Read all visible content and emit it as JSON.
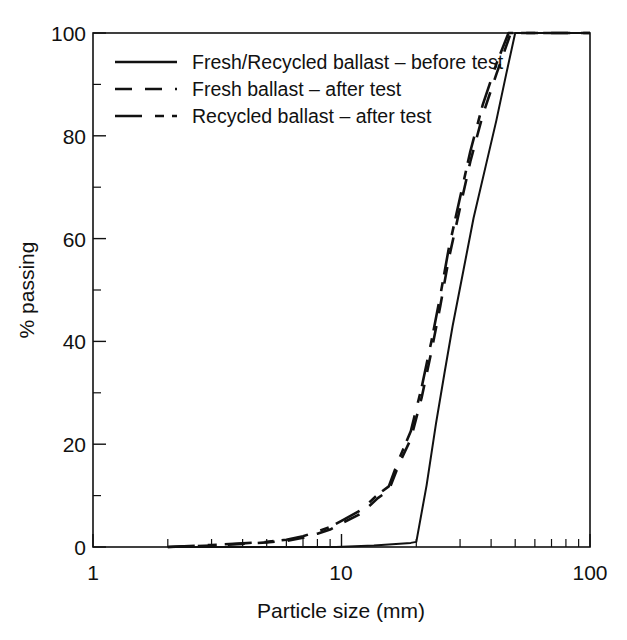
{
  "chart_data": {
    "type": "line",
    "title": "",
    "xlabel": "Particle size (mm)",
    "ylabel": "% passing",
    "xscale": "log",
    "yscale": "linear",
    "xlim": [
      1,
      100
    ],
    "ylim": [
      0,
      100
    ],
    "grid": false,
    "legend_position": "upper left (inside axes)",
    "x_tick_labels": [
      "1",
      "10",
      "100"
    ],
    "x_major_ticks": [
      1,
      10,
      100
    ],
    "x_minor_ticks": [
      2,
      3,
      4,
      5,
      6,
      7,
      8,
      9,
      20,
      30,
      40,
      50,
      60,
      70,
      80,
      90
    ],
    "y_tick_labels": [
      "0",
      "20",
      "40",
      "60",
      "80",
      "100"
    ],
    "y_major_ticks": [
      0,
      20,
      40,
      60,
      80,
      100
    ],
    "y_minor_ticks": [
      10,
      30,
      50,
      70,
      90
    ],
    "series": [
      {
        "name": "Fresh/Recycled ballast – before test",
        "style": "solid",
        "points": [
          [
            2.0,
            0.0
          ],
          [
            9.5,
            0.0
          ],
          [
            13.5,
            0.3
          ],
          [
            19.0,
            0.8
          ],
          [
            20.0,
            1.0
          ],
          [
            22.0,
            12.0
          ],
          [
            24.0,
            24.0
          ],
          [
            26.0,
            34.0
          ],
          [
            28.0,
            43.0
          ],
          [
            31.0,
            54.0
          ],
          [
            34.0,
            64.0
          ],
          [
            38.0,
            74.0
          ],
          [
            42.0,
            83.0
          ],
          [
            46.0,
            92.0
          ],
          [
            50.0,
            100.0
          ],
          [
            100.0,
            100.0
          ]
        ]
      },
      {
        "name": "Fresh ballast – after test",
        "style": "dashed",
        "points": [
          [
            2.0,
            0.0
          ],
          [
            3.0,
            0.3
          ],
          [
            4.0,
            0.6
          ],
          [
            5.0,
            0.9
          ],
          [
            6.0,
            1.2
          ],
          [
            7.0,
            1.8
          ],
          [
            8.0,
            2.6
          ],
          [
            9.0,
            3.4
          ],
          [
            10.0,
            4.6
          ],
          [
            12.0,
            6.5
          ],
          [
            14.0,
            9.5
          ],
          [
            15.5,
            11.0
          ],
          [
            17.0,
            16.0
          ],
          [
            19.0,
            21.0
          ],
          [
            21.0,
            29.0
          ],
          [
            23.0,
            38.0
          ],
          [
            25.0,
            47.0
          ],
          [
            27.0,
            56.0
          ],
          [
            30.0,
            66.0
          ],
          [
            33.0,
            75.0
          ],
          [
            37.0,
            84.0
          ],
          [
            42.0,
            92.0
          ],
          [
            48.0,
            100.0
          ],
          [
            100.0,
            100.0
          ]
        ]
      },
      {
        "name": "Recycled ballast – after test",
        "style": "dashdot",
        "points": [
          [
            2.0,
            0.0
          ],
          [
            3.0,
            0.4
          ],
          [
            4.0,
            0.7
          ],
          [
            5.0,
            1.0
          ],
          [
            6.0,
            1.4
          ],
          [
            7.0,
            2.1
          ],
          [
            8.0,
            3.0
          ],
          [
            9.0,
            3.9
          ],
          [
            10.0,
            5.1
          ],
          [
            12.0,
            7.2
          ],
          [
            14.0,
            10.2
          ],
          [
            15.5,
            11.8
          ],
          [
            17.0,
            17.0
          ],
          [
            19.0,
            22.5
          ],
          [
            21.0,
            31.0
          ],
          [
            23.0,
            40.0
          ],
          [
            25.0,
            49.0
          ],
          [
            27.0,
            58.0
          ],
          [
            30.0,
            68.0
          ],
          [
            33.0,
            77.0
          ],
          [
            37.0,
            86.0
          ],
          [
            42.0,
            94.0
          ],
          [
            47.0,
            100.0
          ],
          [
            100.0,
            100.0
          ]
        ]
      }
    ]
  },
  "legend": {
    "entries": [
      {
        "label": "Fresh/Recycled ballast – before test",
        "style": "solid"
      },
      {
        "label": "Fresh ballast – after test",
        "style": "dashed"
      },
      {
        "label": "Recycled ballast – after test",
        "style": "dashdot"
      }
    ]
  },
  "axes": {
    "x_title": "Particle size (mm)",
    "y_title": "% passing",
    "x_labels": {
      "t0": "1",
      "t1": "10",
      "t2": "100"
    },
    "y_labels": {
      "y0": "0",
      "y20": "20",
      "y40": "40",
      "y60": "60",
      "y80": "80",
      "y100": "100"
    }
  }
}
